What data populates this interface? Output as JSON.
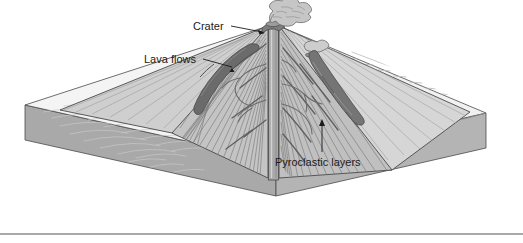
{
  "figure": {
    "background_color": "#ffffff"
  },
  "labels": {
    "crater": "Crater",
    "lava_flows": "Lava flows",
    "pyroclastic_layers": "Pyroclastic layers"
  },
  "colors": {
    "outline": "#4a4a4a",
    "ground_surface": "#f2f2f2",
    "cone_flank_light": "#d9d9d9",
    "cone_flank_shadow": "#b8b8b8",
    "cross_section": "#c2c2c2",
    "slab_front_face": "#b0b0b0",
    "slab_left_face": "#a8a8a8",
    "lava_dark": "#6e6e6e",
    "lava_mid": "#8a8a8a",
    "plume": "#bfbfbf",
    "conduit": "#9a9a9a",
    "label_text": "#1a1a1a",
    "rule_line": "#8c8c8c",
    "strata_line": "#7a7a7a"
  },
  "elements": {
    "ash_plume": "ash-plume",
    "summit_crater": "summit-crater",
    "central_conduit": "central-conduit",
    "secondary_vent": "secondary-vent",
    "left_lava_flow": "left-lava-flow",
    "right_lava_flow": "right-lava-flow",
    "base_slab": "base-slab",
    "bottom_rule": "bottom-rule"
  },
  "leader_lines": {
    "crater_from": [
      231,
      26
    ],
    "crater_to": [
      265,
      34
    ],
    "lava_flows_from": [
      202,
      59
    ],
    "lava_flows_to": [
      232,
      68
    ],
    "pyroclastic_from": [
      322,
      152
    ],
    "pyroclastic_to": [
      322,
      120
    ]
  }
}
